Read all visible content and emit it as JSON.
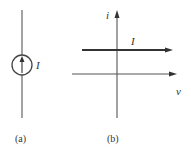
{
  "figure_a": {
    "caption": "(a)",
    "source_label": "I",
    "element": "current-source"
  },
  "figure_b": {
    "caption": "(b)",
    "y_axis_label": "i",
    "x_axis_label": "v",
    "line_label": "I"
  },
  "colors": {
    "line": "#555555",
    "text": "#333333"
  }
}
